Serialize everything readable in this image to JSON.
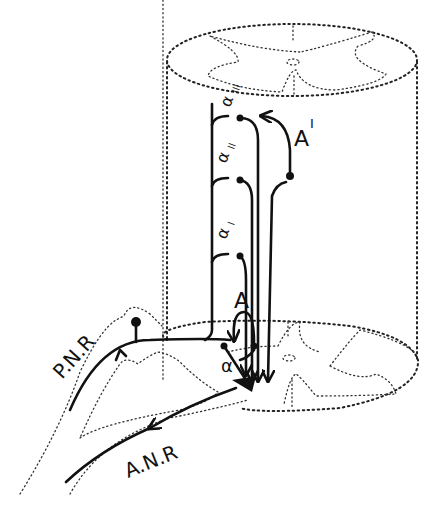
{
  "figure": {
    "type": "neuroanatomy schematic",
    "labels": {
      "posterior_root": "P.N.R",
      "anterior_root": "A.N.R",
      "neuron_A": "A",
      "neuron_A_prime": "A",
      "neuron_A_prime_mark": "I",
      "collateral_alpha": "α",
      "collateral_alpha1": "α",
      "collateral_alpha1_mark": "I",
      "collateral_alpha2": "α",
      "collateral_alpha2_mark": "II",
      "collateral_alpha3": "α",
      "collateral_alpha3_mark": "III"
    },
    "colors": {
      "ink": "#111111",
      "background": "#ffffff"
    }
  }
}
